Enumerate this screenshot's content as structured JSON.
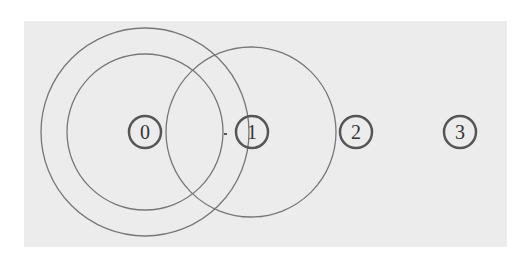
{
  "diagram": {
    "background_color": "#ececec",
    "stroke_color": "#777777",
    "node_stroke_color": "#555555",
    "nodes": [
      {
        "label": "0",
        "cx": 145,
        "cy": 132
      },
      {
        "label": "1",
        "cx": 252,
        "cy": 132
      },
      {
        "label": "2",
        "cx": 356,
        "cy": 132
      },
      {
        "label": "3",
        "cx": 460,
        "cy": 132
      }
    ],
    "rings": [
      {
        "name": "outer-ring-node-0",
        "cx": 145,
        "cy": 132,
        "r": 104
      },
      {
        "name": "inner-ring-node-0",
        "cx": 145,
        "cy": 132,
        "r": 78
      },
      {
        "name": "ring-node-1",
        "cx": 251,
        "cy": 132,
        "r": 85
      }
    ],
    "tick_mark": {
      "x": 226,
      "y": 134
    }
  }
}
